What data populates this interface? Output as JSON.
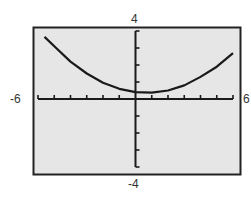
{
  "window": {
    "xmin": "-6",
    "xmax": "6",
    "ymin": "-4",
    "ymax": "4"
  },
  "colors": {
    "screen_bg": "#e6e6e6",
    "frame": "#222222",
    "axis": "#1a1a1a",
    "curve": "#1a1a1a"
  },
  "chart_data": {
    "type": "line",
    "title": "",
    "xlabel": "",
    "ylabel": "",
    "xlim": [
      -6,
      6
    ],
    "ylim": [
      -4,
      4
    ],
    "grid": false,
    "legend": null,
    "tick_labels": {
      "x": [
        "-6",
        "6"
      ],
      "y": [
        "-4",
        "4"
      ]
    },
    "x_ticks_every": 1,
    "y_ticks_every": 1,
    "series": [
      {
        "name": "curve",
        "x": [
          -5.6,
          -5,
          -4,
          -3,
          -2,
          -1,
          0,
          1,
          2,
          3,
          4,
          5,
          6
        ],
        "values": [
          3.65,
          3.1,
          2.2,
          1.5,
          0.95,
          0.6,
          0.4,
          0.37,
          0.5,
          0.8,
          1.3,
          1.9,
          2.7
        ]
      }
    ]
  }
}
